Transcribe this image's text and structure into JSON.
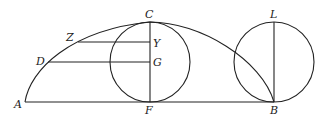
{
  "diagram": {
    "type": "geometric-construction",
    "labels": {
      "A": "A",
      "B": "B",
      "C": "C",
      "D": "D",
      "F": "F",
      "G": "G",
      "L": "L",
      "Y": "Y",
      "Z": "Z"
    },
    "points": {
      "A": [
        25,
        102
      ],
      "B": [
        274,
        102
      ],
      "C": [
        150,
        22
      ],
      "F": [
        150,
        102
      ],
      "G": [
        150,
        62
      ],
      "Y": [
        150,
        42
      ],
      "Z": [
        78,
        42
      ],
      "D": [
        48,
        62
      ],
      "L": [
        274,
        22
      ]
    },
    "circles": [
      {
        "name": "left-circle",
        "center": [
          150,
          62
        ],
        "radius": 40
      },
      {
        "name": "right-circle",
        "center": [
          274,
          62
        ],
        "radius": 40
      }
    ],
    "segments": [
      [
        "A",
        "B"
      ],
      [
        "C",
        "F"
      ],
      [
        "L",
        "B"
      ],
      [
        "Z",
        "Y"
      ],
      [
        "D",
        "G"
      ]
    ],
    "curve": "arc from A through C to B"
  }
}
